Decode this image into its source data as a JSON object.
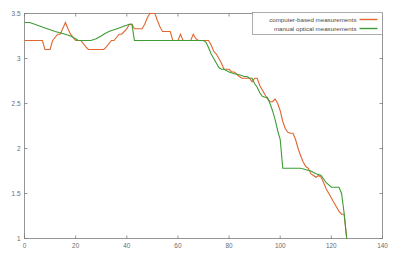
{
  "chart_data": {
    "type": "line",
    "title": "",
    "xlabel": "",
    "ylabel": "",
    "xlim": [
      0,
      140
    ],
    "ylim": [
      1,
      3.5
    ],
    "xticks": [
      0,
      20,
      40,
      60,
      80,
      100,
      120,
      140
    ],
    "yticks": [
      1,
      1.5,
      2,
      2.5,
      3,
      3.5
    ],
    "xtick_labels": [
      "0",
      "20",
      "40",
      "60",
      "80",
      "100",
      "120",
      "140"
    ],
    "ytick_labels": [
      "1",
      "1.5",
      "2",
      "2.5",
      "3",
      "3.5"
    ],
    "grid": false,
    "legend_position": "top-right",
    "background_color": "#ffffff",
    "axis_color": "#7a7a7a",
    "series": [
      {
        "name": "computer-based measurements",
        "color": "#e0662f",
        "x": [
          0,
          2,
          4,
          6,
          7,
          8,
          10,
          11,
          13,
          14,
          16,
          17,
          18,
          20,
          21,
          22,
          24,
          25,
          27,
          29,
          31,
          32,
          34,
          35,
          37,
          38,
          40,
          41,
          42,
          43,
          44,
          46,
          47,
          48,
          49,
          51,
          52,
          53,
          54,
          56,
          57,
          58,
          59,
          60,
          61,
          62,
          63,
          64,
          65,
          66,
          67,
          68,
          70,
          71,
          72,
          73,
          74,
          75,
          76,
          77,
          78,
          80,
          81,
          82,
          84,
          85,
          86,
          87,
          88,
          89,
          90,
          91,
          92,
          93,
          94,
          95,
          96,
          97,
          98,
          99,
          100,
          101,
          102,
          103,
          104,
          105,
          106,
          107,
          108,
          109,
          110,
          111,
          112,
          113,
          114,
          115,
          116,
          117,
          118,
          119,
          120,
          121,
          122,
          123,
          124,
          125,
          126
        ],
        "y": [
          3.2,
          3.2,
          3.2,
          3.2,
          3.2,
          3.1,
          3.1,
          3.2,
          3.27,
          3.27,
          3.4,
          3.33,
          3.27,
          3.2,
          3.2,
          3.2,
          3.13,
          3.1,
          3.1,
          3.1,
          3.1,
          3.13,
          3.2,
          3.2,
          3.27,
          3.27,
          3.33,
          3.38,
          3.38,
          3.33,
          3.33,
          3.33,
          3.38,
          3.45,
          3.5,
          3.5,
          3.42,
          3.35,
          3.3,
          3.3,
          3.3,
          3.2,
          3.2,
          3.2,
          3.27,
          3.2,
          3.2,
          3.2,
          3.2,
          3.27,
          3.22,
          3.2,
          3.2,
          3.2,
          3.2,
          3.15,
          3.08,
          3.05,
          3.0,
          2.95,
          2.88,
          2.88,
          2.85,
          2.85,
          2.8,
          2.78,
          2.78,
          2.78,
          2.78,
          2.74,
          2.78,
          2.78,
          2.7,
          2.65,
          2.6,
          2.55,
          2.52,
          2.52,
          2.55,
          2.5,
          2.42,
          2.3,
          2.22,
          2.18,
          2.17,
          2.17,
          2.1,
          2.0,
          1.92,
          1.85,
          1.8,
          1.78,
          1.72,
          1.7,
          1.68,
          1.7,
          1.68,
          1.62,
          1.55,
          1.5,
          1.45,
          1.4,
          1.35,
          1.3,
          1.27,
          1.27,
          1.0
        ]
      },
      {
        "name": "manual optical measurements",
        "color": "#3f9c35",
        "x": [
          0,
          2,
          4,
          8,
          12,
          16,
          18,
          20,
          21,
          22,
          24,
          26,
          28,
          30,
          31,
          33,
          35,
          37,
          39,
          40,
          41,
          42,
          43,
          44,
          50,
          60,
          66,
          68,
          70,
          71,
          72,
          73,
          74,
          75,
          76,
          77,
          78,
          80,
          82,
          84,
          86,
          87,
          88,
          89,
          90,
          91,
          92,
          93,
          94,
          95,
          96,
          97,
          98,
          99,
          100,
          101,
          108,
          112,
          114,
          116,
          118,
          120,
          121,
          122,
          123,
          124,
          125,
          126
        ],
        "y": [
          3.4,
          3.4,
          3.38,
          3.34,
          3.3,
          3.27,
          3.25,
          3.22,
          3.2,
          3.2,
          3.2,
          3.2,
          3.22,
          3.25,
          3.27,
          3.3,
          3.32,
          3.34,
          3.36,
          3.37,
          3.38,
          3.38,
          3.2,
          3.2,
          3.2,
          3.2,
          3.2,
          3.2,
          3.2,
          3.18,
          3.12,
          3.05,
          3.0,
          2.95,
          2.9,
          2.88,
          2.88,
          2.85,
          2.83,
          2.82,
          2.8,
          2.8,
          2.78,
          2.78,
          2.72,
          2.68,
          2.62,
          2.58,
          2.57,
          2.57,
          2.5,
          2.42,
          2.32,
          2.2,
          2.1,
          1.78,
          1.78,
          1.75,
          1.72,
          1.7,
          1.62,
          1.57,
          1.57,
          1.57,
          1.57,
          1.5,
          1.28,
          1.0
        ]
      }
    ],
    "legend": [
      {
        "label": "computer-based measurements",
        "color": "#e0662f"
      },
      {
        "label": "manual optical measurements",
        "color": "#3f9c35"
      }
    ]
  }
}
